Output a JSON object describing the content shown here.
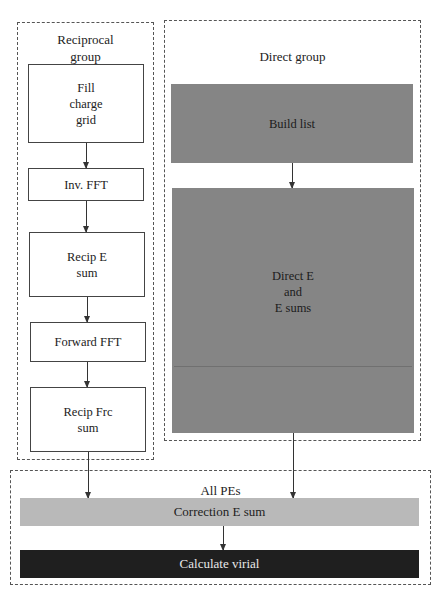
{
  "diagram": {
    "reciprocal_group": {
      "label": "Reciprocal\ngroup",
      "steps": [
        {
          "id": "fill-charge-grid",
          "label": "Fill\ncharge\ngrid"
        },
        {
          "id": "inv-fft",
          "label": "Inv. FFT"
        },
        {
          "id": "recip-e-sum",
          "label": "Recip E\nsum"
        },
        {
          "id": "forward-fft",
          "label": "Forward FFT"
        },
        {
          "id": "recip-frc-sum",
          "label": "Recip Frc\nsum"
        }
      ]
    },
    "direct_group": {
      "label": "Direct group",
      "steps": [
        {
          "id": "build-list",
          "label": "Build list"
        },
        {
          "id": "direct-e-and-e-sums",
          "label": "Direct E\nand\nE sums"
        }
      ]
    },
    "all_pes": {
      "label": "All PEs",
      "steps": [
        {
          "id": "correction-e-sum",
          "label": "Correction E sum"
        },
        {
          "id": "calculate-virial",
          "label": "Calculate virial"
        }
      ]
    },
    "colors": {
      "white_box": "#ffffff",
      "direct_box": "#858585",
      "correction_box": "#b9b9b9",
      "virial_box": "#1f1f1f",
      "border": "#444444"
    }
  }
}
